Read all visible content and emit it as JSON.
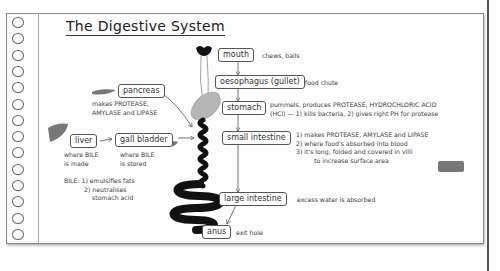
{
  "title": "The Digestive System",
  "organs": {
    "mouth": {
      "label": "mouth",
      "note": "chews, balls"
    },
    "oesophagus": {
      "label": "oesophagus (gullet)",
      "note": "food chute"
    },
    "stomach": {
      "label": "stomach",
      "note_lines": [
        "pummels, produces PROTEASE, HYDROCHLORIC ACID",
        "(HCl) — 1) kills bacteria, 2) gives right PH for protease"
      ]
    },
    "small_intestine": {
      "label": "small intestine",
      "note_lines": [
        "1) makes PROTEASE, AMYLASE and LIPASE",
        "2) where food's absorbed into blood",
        "3) it's long, folded and covered in villi",
        "to increase surface area"
      ]
    },
    "large_intestine": {
      "label": "large intestine",
      "note": "excess water is absorbed"
    },
    "anus": {
      "label": "anus",
      "note": "exit hole"
    },
    "pancreas": {
      "label": "pancreas",
      "note_lines": [
        "makes PROTEASE,",
        "AMYLASE and LIPASE"
      ]
    },
    "liver": {
      "label": "liver",
      "note_lines": [
        "where BILE",
        "is made"
      ]
    },
    "gall_bladder": {
      "label": "gall bladder",
      "note_lines": [
        "where BILE",
        "is stored"
      ]
    },
    "bile": {
      "note_lines": [
        "BILE: 1) emulsifies fats",
        "2) neutralises",
        "stomach acid"
      ]
    }
  },
  "colors": {
    "organ_dark": "#111111",
    "organ_grey": "#b5b5b5",
    "liver": "#777777",
    "ink": "#333333"
  }
}
